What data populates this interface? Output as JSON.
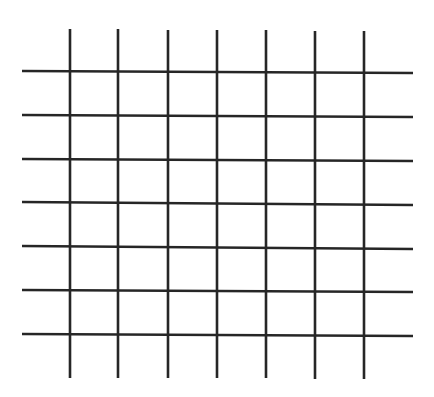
{
  "diagram": {
    "type": "grid",
    "background": "#ffffff",
    "line_color": "#262626",
    "line_width": 2.6,
    "horizontal_lines": [
      {
        "y1": 71,
        "y2": 73,
        "x1": 22,
        "x2": 413
      },
      {
        "y1": 115,
        "y2": 117,
        "x1": 22,
        "x2": 413
      },
      {
        "y1": 159,
        "y2": 161,
        "x1": 22,
        "x2": 413
      },
      {
        "y1": 202,
        "y2": 205,
        "x1": 22,
        "x2": 413
      },
      {
        "y1": 246,
        "y2": 249,
        "x1": 22,
        "x2": 413
      },
      {
        "y1": 290,
        "y2": 292,
        "x1": 22,
        "x2": 413
      },
      {
        "y1": 334,
        "y2": 336,
        "x1": 22,
        "x2": 413
      }
    ],
    "vertical_lines": [
      {
        "x": 70,
        "y1": 29,
        "y2": 378
      },
      {
        "x": 118,
        "y1": 29,
        "y2": 378
      },
      {
        "x": 168,
        "y1": 30,
        "y2": 378
      },
      {
        "x": 217,
        "y1": 30,
        "y2": 378
      },
      {
        "x": 266,
        "y1": 30,
        "y2": 378
      },
      {
        "x": 315,
        "y1": 31,
        "y2": 379
      },
      {
        "x": 364,
        "y1": 31,
        "y2": 379
      }
    ]
  }
}
